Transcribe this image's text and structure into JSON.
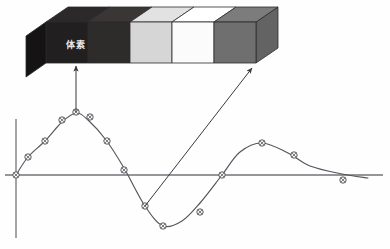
{
  "figure": {
    "background_color": "#fefefe",
    "line_color": "#55555a",
    "axis_color": "#6e6e73"
  },
  "voxel_bar": {
    "name": "voxel-strip",
    "label_text": "体素",
    "label_color": "#e8e8e8",
    "outline_color": "#2b2b2b",
    "geometry": {
      "front_left_x": 46,
      "front_right_x": 256,
      "front_top_y": 22,
      "front_bottom_y": 63,
      "depth_dx": 22,
      "depth_dy": -15
    },
    "segments": [
      {
        "name": "voxel-cell-1",
        "front_color": "#211f1f",
        "top_color": "#2b2929",
        "side_color": "#1a1818"
      },
      {
        "name": "voxel-cell-2",
        "front_color": "#2e2b2b",
        "top_color": "#3a3636",
        "side_color": "#242121"
      },
      {
        "name": "voxel-cell-3",
        "front_color": "#d6d6d6",
        "top_color": "#e2e2e2",
        "side_color": "#c4c4c4"
      },
      {
        "name": "voxel-cell-4",
        "front_color": "#fbfbfb",
        "top_color": "#ffffff",
        "side_color": "#ededed"
      },
      {
        "name": "voxel-cell-5",
        "front_color": "#6f6f6f",
        "top_color": "#7c7c7c",
        "side_color": "#636363"
      }
    ]
  },
  "callouts": [
    {
      "name": "callout-arrow-peak",
      "from_x": 76,
      "from_y": 112,
      "to_x": 76,
      "to_y": 66,
      "description": "arrow from curve peak sample to first voxel cell"
    },
    {
      "name": "callout-arrow-trough",
      "from_x": 145,
      "from_y": 206,
      "to_x": 252,
      "to_y": 68,
      "description": "arrow from descending-curve sample to last voxel cell"
    }
  ],
  "chart_data": {
    "type": "line",
    "title": "",
    "subtitle": "",
    "xlabel": "",
    "ylabel": "",
    "grid": false,
    "legend": null,
    "axes": {
      "x_axis_y_px": 175,
      "x_axis_from_px": 5,
      "x_axis_to_px": 383,
      "y_axis_x_px": 16,
      "y_axis_from_px": 119,
      "y_axis_to_px": 238
    },
    "curve_description": "damped sinusoid crossing zero at the origin, peaking near x=76, troughing near x=165, second smaller peak near x=262, settling toward zero at the right edge",
    "x": [
      16,
      28,
      45,
      62,
      76,
      88,
      106,
      124,
      145,
      163,
      182,
      200,
      222,
      240,
      262,
      288,
      310,
      342,
      368
    ],
    "y": [
      175,
      157,
      141,
      122,
      113,
      120,
      140,
      168,
      206,
      226,
      221,
      203,
      175,
      152,
      143,
      153,
      166,
      174,
      178
    ],
    "points": [
      {
        "name": "sample-point-1",
        "x": 16,
        "y": 175
      },
      {
        "name": "sample-point-2",
        "x": 28,
        "y": 157
      },
      {
        "name": "sample-point-3",
        "x": 45,
        "y": 141
      },
      {
        "name": "sample-point-4",
        "x": 62,
        "y": 120
      },
      {
        "name": "sample-point-5",
        "x": 76,
        "y": 112
      },
      {
        "name": "sample-point-6",
        "x": 90,
        "y": 117
      },
      {
        "name": "sample-point-7",
        "x": 107,
        "y": 141
      },
      {
        "name": "sample-point-8",
        "x": 124,
        "y": 170
      },
      {
        "name": "sample-point-9",
        "x": 145,
        "y": 206
      },
      {
        "name": "sample-point-10",
        "x": 163,
        "y": 226
      },
      {
        "name": "sample-point-11",
        "x": 200,
        "y": 212
      },
      {
        "name": "sample-point-12",
        "x": 222,
        "y": 175
      },
      {
        "name": "sample-point-13",
        "x": 262,
        "y": 143
      },
      {
        "name": "sample-point-14",
        "x": 294,
        "y": 155
      },
      {
        "name": "sample-point-15",
        "x": 343,
        "y": 180
      }
    ],
    "marker": {
      "shape": "circle-with-cross",
      "radius_px": 3.2,
      "fill": "#f4f4f4",
      "stroke": "#4c4c50"
    }
  }
}
